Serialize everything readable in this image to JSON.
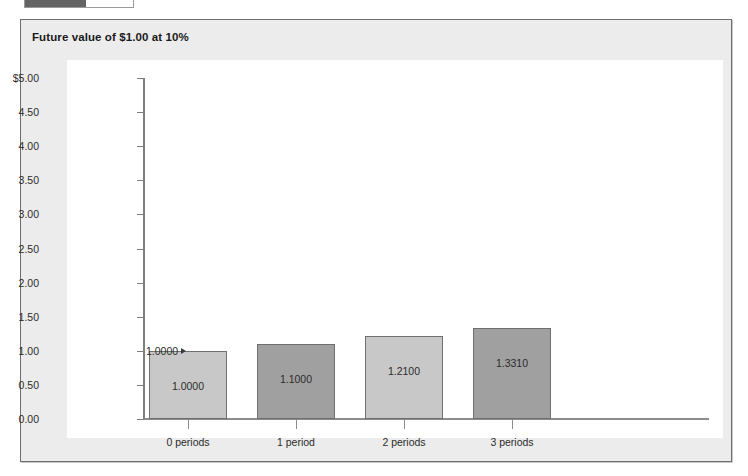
{
  "top_widget": {
    "name": "progress-bar",
    "fill_percent": 55,
    "fill_color": "#636363"
  },
  "panel": {
    "background": "#ececec",
    "border_color": "#6e6e6e"
  },
  "chart_data": {
    "type": "bar",
    "title": "Future value of $1.00 at 10%",
    "xlabel": "",
    "ylabel": "",
    "categories": [
      "0 periods",
      "1 period",
      "2 periods",
      "3 periods"
    ],
    "values": [
      1.0,
      1.1,
      1.21,
      1.331
    ],
    "value_labels": [
      "1.0000",
      "1.1000",
      "1.2100",
      "1.3310"
    ],
    "bar_colors": [
      "#c8c8c8",
      "#a0a0a0",
      "#c8c8c8",
      "#a0a0a0"
    ],
    "ylim": [
      0.0,
      5.0
    ],
    "yticks": [
      0.0,
      0.5,
      1.0,
      1.5,
      2.0,
      2.5,
      3.0,
      3.5,
      4.0,
      4.5,
      5.0
    ],
    "ytick_labels": [
      "0.00",
      "0.50",
      "1.00",
      "1.50",
      "2.00",
      "2.50",
      "3.00",
      "3.50",
      "4.00",
      "4.50",
      "$5.00"
    ],
    "grid": false,
    "legend": "none",
    "annotations": [
      {
        "text": "1.0000",
        "points_to": "0 periods",
        "value": 1.0
      }
    ]
  }
}
